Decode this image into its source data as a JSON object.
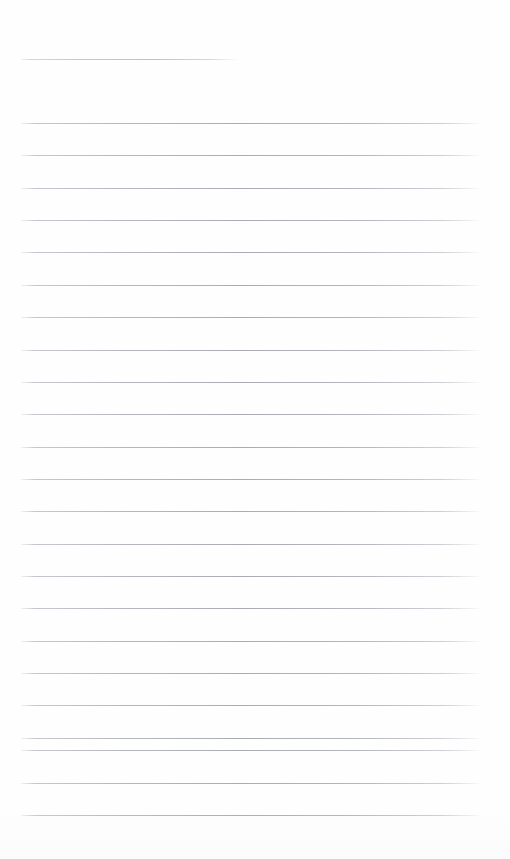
{
  "document": {
    "kind": "ruled-notebook-page",
    "title": "Blank lined page",
    "written_content": "",
    "page_width": 510,
    "page_height": 859,
    "background_color": "#fefefe",
    "rule_color": "#aaacb4",
    "rule_thickness_px": 1,
    "rule_spacing_px": 32.35,
    "margin_left_px": 21,
    "margin_right_px": 479,
    "first_rule_y_px": 59,
    "last_rule_y_px": 815,
    "top_blank_band_px": 59,
    "bottom_blank_band_px": 44,
    "rule_count": 24
  },
  "rules": [
    {
      "index": 1,
      "y": 59,
      "x_start": 21,
      "x_end": 237,
      "variant": "short"
    },
    {
      "index": 2,
      "y": 123,
      "x_start": 21,
      "x_end": 479,
      "variant": "full"
    },
    {
      "index": 3,
      "y": 155.4,
      "x_start": 21,
      "x_end": 479,
      "variant": "full"
    },
    {
      "index": 4,
      "y": 187.7,
      "x_start": 21,
      "x_end": 479,
      "variant": "full"
    },
    {
      "index": 5,
      "y": 220.1,
      "x_start": 21,
      "x_end": 479,
      "variant": "full"
    },
    {
      "index": 6,
      "y": 252.4,
      "x_start": 21,
      "x_end": 479,
      "variant": "full"
    },
    {
      "index": 7,
      "y": 284.8,
      "x_start": 21,
      "x_end": 479,
      "variant": "full"
    },
    {
      "index": 8,
      "y": 317.1,
      "x_start": 21,
      "x_end": 479,
      "variant": "full"
    },
    {
      "index": 9,
      "y": 349.5,
      "x_start": 21,
      "x_end": 479,
      "variant": "full"
    },
    {
      "index": 10,
      "y": 381.8,
      "x_start": 21,
      "x_end": 479,
      "variant": "full"
    },
    {
      "index": 11,
      "y": 414.2,
      "x_start": 21,
      "x_end": 479,
      "variant": "full"
    },
    {
      "index": 12,
      "y": 446.5,
      "x_start": 21,
      "x_end": 479,
      "variant": "full"
    },
    {
      "index": 13,
      "y": 478.9,
      "x_start": 21,
      "x_end": 479,
      "variant": "full"
    },
    {
      "index": 14,
      "y": 511.2,
      "x_start": 21,
      "x_end": 479,
      "variant": "full"
    },
    {
      "index": 15,
      "y": 543.6,
      "x_start": 21,
      "x_end": 479,
      "variant": "full"
    },
    {
      "index": 16,
      "y": 575.9,
      "x_start": 21,
      "x_end": 479,
      "variant": "full"
    },
    {
      "index": 17,
      "y": 608.3,
      "x_start": 21,
      "x_end": 479,
      "variant": "full"
    },
    {
      "index": 18,
      "y": 640.6,
      "x_start": 21,
      "x_end": 479,
      "variant": "full"
    },
    {
      "index": 19,
      "y": 673.0,
      "x_start": 21,
      "x_end": 479,
      "variant": "full"
    },
    {
      "index": 20,
      "y": 705.3,
      "x_start": 21,
      "x_end": 479,
      "variant": "full"
    },
    {
      "index": 21,
      "y": 737.7,
      "x_start": 21,
      "x_end": 479,
      "variant": "full"
    },
    {
      "index": 22,
      "y": 750.0,
      "x_start": 21,
      "x_end": 479,
      "variant": "full"
    },
    {
      "index": 23,
      "y": 782.5,
      "x_start": 21,
      "x_end": 479,
      "variant": "full"
    },
    {
      "index": 24,
      "y": 815.0,
      "x_start": 21,
      "x_end": 479,
      "variant": "full"
    }
  ]
}
